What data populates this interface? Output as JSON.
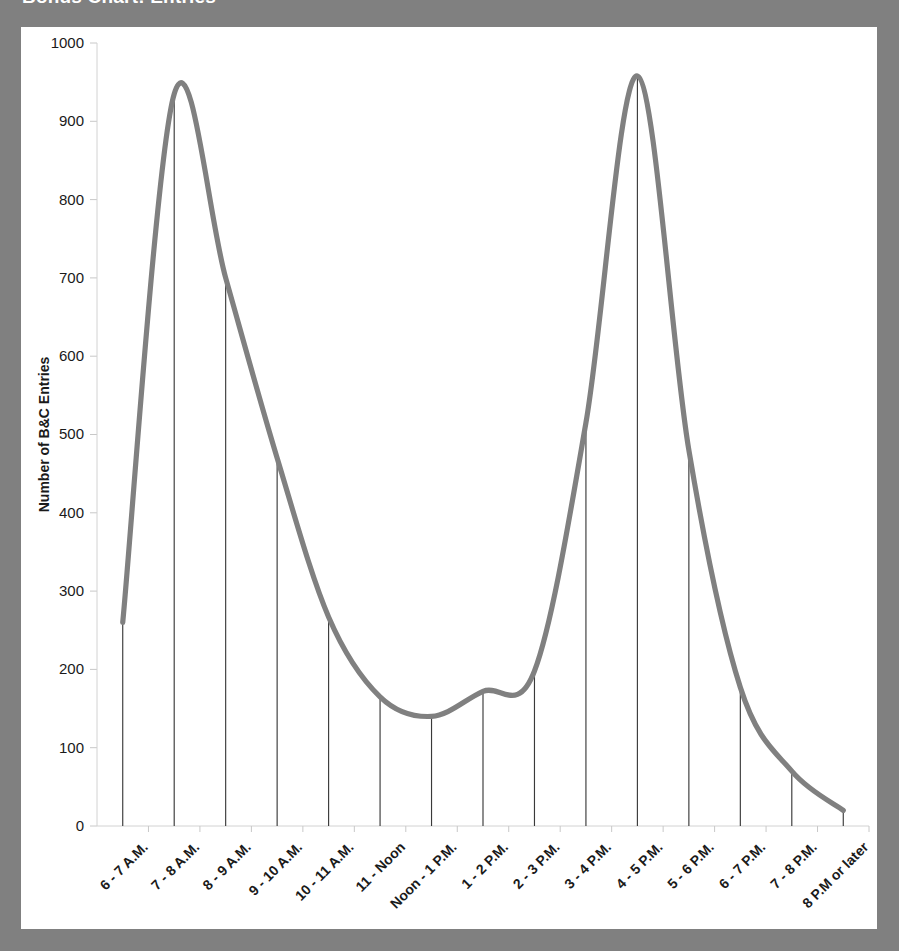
{
  "window": {
    "background_color": "#808080",
    "card_background_color": "#ffffff",
    "title_partial": "Bonus Chart: Entries"
  },
  "chart_data": {
    "type": "line",
    "title": "Bonus Chart: Entries",
    "xlabel": "",
    "ylabel": "Number of B&C Entries",
    "ylim": [
      0,
      1000
    ],
    "ytick_step": 100,
    "ytick_labels": [
      "0",
      "100",
      "200",
      "300",
      "400",
      "500",
      "600",
      "700",
      "800",
      "900",
      "1000"
    ],
    "yticks": [
      0,
      100,
      200,
      300,
      400,
      500,
      600,
      700,
      800,
      900,
      1000
    ],
    "grid": false,
    "legend": "none",
    "line_color": "#808080",
    "dropline_color": "#3a3a3a",
    "smoothing": "spline",
    "categories": [
      "6 - 7 A.M.",
      "7 - 8 A.M.",
      "8 - 9 A.M.",
      "9 - 10 A.M.",
      "10 - 11 A.M.",
      "11 - Noon",
      "Noon - 1 P.M.",
      "1 - 2 P.M.",
      "2 - 3 P.M.",
      "3 - 4 P.M.",
      "4 - 5 P.M.",
      "5 - 6 P.M.",
      "6 - 7 P.M.",
      "7 - 8 P.M.",
      "8 P.M or later"
    ],
    "values": [
      260,
      935,
      700,
      470,
      267,
      165,
      140,
      172,
      198,
      515,
      958,
      480,
      177,
      70,
      20
    ],
    "series": [
      {
        "name": "Number of B&C Entries",
        "values": [
          260,
          935,
          700,
          470,
          267,
          165,
          140,
          172,
          198,
          515,
          958,
          480,
          177,
          70,
          20
        ]
      }
    ]
  }
}
